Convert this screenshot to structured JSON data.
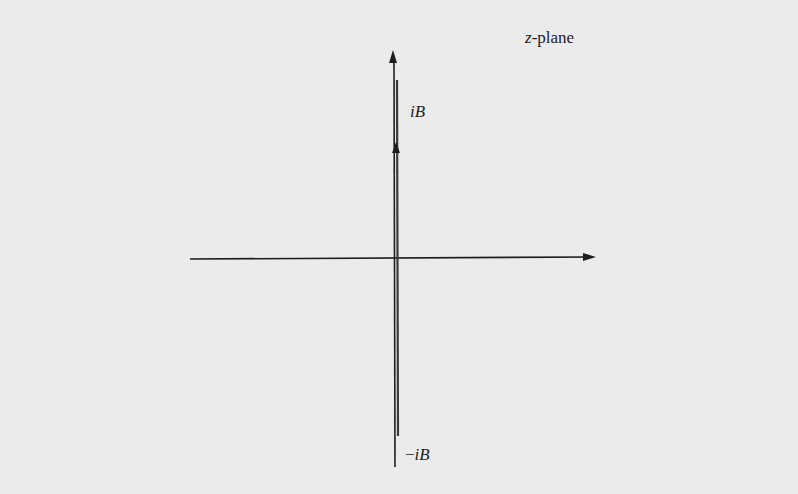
{
  "diagram": {
    "title": "z-plane",
    "title_var": "z",
    "title_suffix": "-plane",
    "labels": {
      "upper_point": {
        "prefix": "",
        "var": "iB"
      },
      "lower_point": {
        "prefix": "−",
        "var": "iB"
      }
    },
    "axes": {
      "horizontal": {
        "name": "real-axis",
        "from_x": 190,
        "to_x": 595,
        "y": 258,
        "arrow": "right"
      },
      "vertical": {
        "name": "imaginary-axis",
        "x": 396,
        "from_y": 467,
        "to_y": 52,
        "arrow": "up"
      }
    },
    "branch_cut": {
      "from": "-iB",
      "to": "iB",
      "top_y": 80,
      "bottom_y": 435,
      "arrow_direction": "up",
      "arrow_y": 148
    },
    "colors": {
      "background": "#ebebeb",
      "ink": "#1e1e1e",
      "cut": "#3a3a3a"
    }
  }
}
